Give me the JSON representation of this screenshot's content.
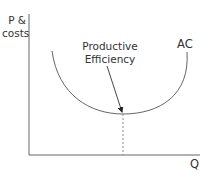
{
  "diagram": {
    "title": "Productive Efficiency",
    "y_axis": {
      "label_line1": "P &",
      "label_line2": "costs"
    },
    "x_axis": {
      "label": "Q"
    },
    "curve": {
      "label": "AC",
      "color": "#555555"
    },
    "annotation": {
      "line1": "Productive",
      "line2": "Efficiency"
    },
    "colors": {
      "axis": "#666666",
      "text": "#333333",
      "dash": "#888888"
    }
  }
}
